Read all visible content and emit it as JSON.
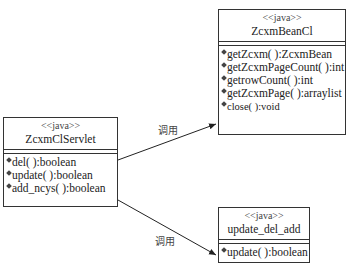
{
  "classes": {
    "bean": {
      "stereotype": "<<java>>",
      "name": "ZcxmBeanCl",
      "operations": [
        "getZcxm( ):ZcxmBean",
        "getZcxmPageCount( ):int",
        "getrowCount( ):int",
        "getZcxmPage( ):arraylist",
        "close( ):void"
      ]
    },
    "servlet": {
      "stereotype": "<<java>>",
      "name": "ZcxmClServlet",
      "operations": [
        "del( ):boolean",
        "update( ):boolean",
        "add_ncys( ):boolean"
      ]
    },
    "update": {
      "stereotype": "<<java>>",
      "name": "update_del_add",
      "operations": [
        "update( ):boolean"
      ]
    }
  },
  "relations": [
    {
      "from": "ZcxmClServlet",
      "to": "ZcxmBeanCl",
      "label": "调用"
    },
    {
      "from": "ZcxmClServlet",
      "to": "update_del_add",
      "label": "调用"
    }
  ]
}
